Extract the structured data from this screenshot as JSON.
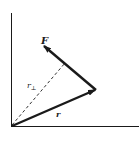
{
  "diagram": {
    "title": "",
    "labels": {
      "force": "F",
      "moment_arm": "r",
      "moment_arm_subscript": "⊥",
      "position": "r"
    },
    "colors": {
      "background": "#ffffff",
      "stroke": "#1a1a1a"
    },
    "elements": [
      {
        "id": "y-axis",
        "type": "axis"
      },
      {
        "id": "x-axis",
        "type": "axis"
      },
      {
        "id": "position-vector",
        "label": "r",
        "type": "vector"
      },
      {
        "id": "force-vector",
        "label": "F",
        "type": "vector"
      },
      {
        "id": "moment-arm",
        "label": "r⊥",
        "type": "dashed-line"
      }
    ]
  }
}
